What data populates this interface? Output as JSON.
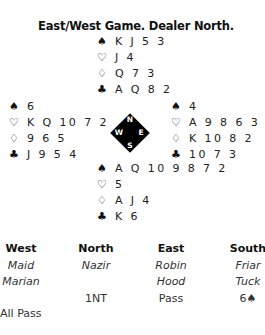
{
  "title": "East/West Game. Dealer North.",
  "suits": {
    "spades": "♠",
    "hearts": "♡",
    "diamonds": "♢",
    "clubs": "♣"
  },
  "hands": {
    "north": {
      "spades": "K J 5 3",
      "hearts": "J 4",
      "diamonds": "Q 7 3",
      "clubs": "A Q 8 2"
    },
    "west": {
      "spades": "6",
      "hearts": "K Q 10 7 2",
      "diamonds": "9 6 5",
      "clubs": "J 9 5 4"
    },
    "east": {
      "spades": "4",
      "hearts": "A 9 8 6 3",
      "diamonds": "K 10 8 2",
      "clubs": "10 7 3"
    },
    "south": {
      "spades": "A Q 10 9 8 7 2",
      "hearts": "5",
      "diamonds": "A J 4",
      "clubs": "K 6"
    }
  },
  "compass": {
    "n": "N",
    "e": "E",
    "s": "S",
    "w": "W"
  },
  "auction": {
    "headers": [
      "West",
      "North",
      "East",
      "South"
    ],
    "players_line1": [
      "Maid",
      "Nazir",
      "Robin",
      "Friar"
    ],
    "players_line2": [
      "Marian",
      "",
      "Hood",
      "Tuck"
    ],
    "bids_round1": [
      "",
      "1NT",
      "Pass",
      "6♠"
    ],
    "final": "All Pass"
  }
}
